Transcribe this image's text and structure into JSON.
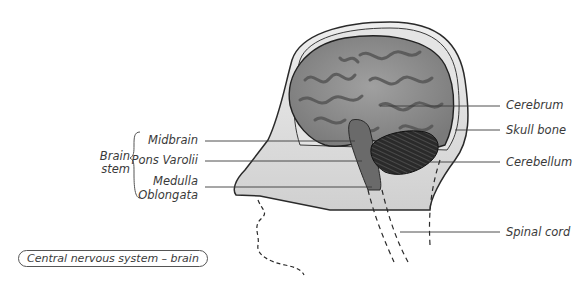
{
  "diagram": {
    "caption": "Central nervous system – brain",
    "group_label": {
      "line1": "Brain",
      "line2": "stem"
    },
    "left_labels": [
      {
        "text": "Midbrain"
      },
      {
        "text": "Pons Varolii"
      },
      {
        "text": "Medulla"
      },
      {
        "text": "Oblongata"
      }
    ],
    "right_labels": [
      {
        "text": "Cerebrum"
      },
      {
        "text": "Skull bone"
      },
      {
        "text": "Cerebellum"
      },
      {
        "text": "Spinal cord"
      }
    ],
    "colors": {
      "line": "#3a3a3a",
      "brain_fill": "#8a8a8a",
      "gyri": "#555555",
      "skin": "#d8d8d8"
    }
  }
}
